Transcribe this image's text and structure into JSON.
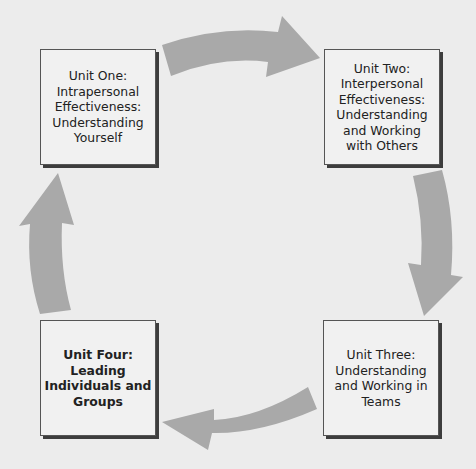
{
  "diagram": {
    "type": "cycle",
    "colors": {
      "background": "#ececec",
      "box_fill": "#f1f1f1",
      "box_border": "#555555",
      "arrow": "#a9a9a9",
      "text": "#222222"
    },
    "units": [
      {
        "id": "unit-one",
        "text": "Unit One:\nIntrapersonal\nEffectiveness:\nUnderstanding\nYourself",
        "bold": false,
        "position": "top-left"
      },
      {
        "id": "unit-two",
        "text": "Unit Two:\nInterpersonal\nEffectiveness:\nUnderstanding\nand Working\nwith Others",
        "bold": false,
        "position": "top-right"
      },
      {
        "id": "unit-three",
        "text": "Unit Three:\nUnderstanding\nand Working in\nTeams",
        "bold": false,
        "position": "bottom-right"
      },
      {
        "id": "unit-four",
        "text": "Unit Four:\nLeading\nIndividuals and\nGroups",
        "bold": true,
        "position": "bottom-left"
      }
    ],
    "arrows": [
      {
        "from": "unit-one",
        "to": "unit-two",
        "direction": "right"
      },
      {
        "from": "unit-two",
        "to": "unit-three",
        "direction": "down"
      },
      {
        "from": "unit-three",
        "to": "unit-four",
        "direction": "left"
      },
      {
        "from": "unit-four",
        "to": "unit-one",
        "direction": "up"
      }
    ]
  }
}
